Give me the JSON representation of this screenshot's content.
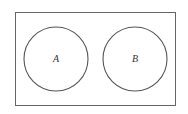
{
  "diagram": {
    "type": "venn",
    "universe_label": "",
    "sets": [
      {
        "id": "A",
        "label": "A"
      },
      {
        "id": "B",
        "label": "B"
      }
    ],
    "relationship": "disjoint",
    "stroke_color": "#555555"
  }
}
